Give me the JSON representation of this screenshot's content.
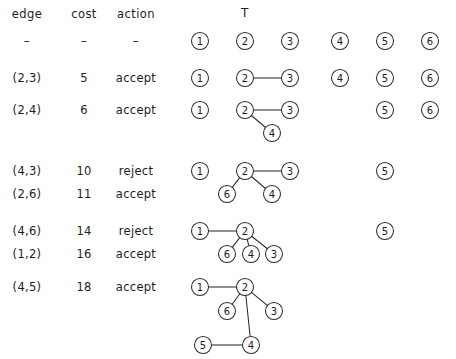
{
  "figure": {
    "title_label": "T",
    "columns": [
      {
        "key": "edge",
        "label": "edge",
        "x": 27
      },
      {
        "key": "cost",
        "label": "cost",
        "x": 84
      },
      {
        "key": "action",
        "label": "action",
        "x": 136
      }
    ],
    "header_rule": "–",
    "node_radius": 8.5,
    "node_ids": [
      "1",
      "2",
      "3",
      "4",
      "5",
      "6"
    ],
    "rows": [
      {
        "edge": "–",
        "cost": "–",
        "action": "–",
        "text_y": 41,
        "is_rule_row": true,
        "nodes": [
          {
            "id": "1",
            "x": 200,
            "y": 41
          },
          {
            "id": "2",
            "x": 245,
            "y": 41
          },
          {
            "id": "3",
            "x": 290,
            "y": 41
          },
          {
            "id": "4",
            "x": 340,
            "y": 41
          },
          {
            "id": "5",
            "x": 385,
            "y": 41
          },
          {
            "id": "6",
            "x": 430,
            "y": 41
          }
        ],
        "edges": []
      },
      {
        "edge": "(2,3)",
        "cost": "5",
        "action": "accept",
        "text_y": 78,
        "is_rule_row": false,
        "nodes": [
          {
            "id": "1",
            "x": 200,
            "y": 78
          },
          {
            "id": "2",
            "x": 245,
            "y": 78
          },
          {
            "id": "3",
            "x": 290,
            "y": 78
          },
          {
            "id": "4",
            "x": 340,
            "y": 78
          },
          {
            "id": "5",
            "x": 385,
            "y": 78
          },
          {
            "id": "6",
            "x": 430,
            "y": 78
          }
        ],
        "edges": [
          [
            "2",
            "3"
          ]
        ]
      },
      {
        "edge": "(2,4)",
        "cost": "6",
        "action": "accept",
        "text_y": 110,
        "is_rule_row": false,
        "nodes": [
          {
            "id": "1",
            "x": 200,
            "y": 110
          },
          {
            "id": "2",
            "x": 245,
            "y": 110
          },
          {
            "id": "3",
            "x": 290,
            "y": 110
          },
          {
            "id": "4",
            "x": 272,
            "y": 133
          },
          {
            "id": "5",
            "x": 385,
            "y": 110
          },
          {
            "id": "6",
            "x": 430,
            "y": 110
          }
        ],
        "edges": [
          [
            "2",
            "3"
          ],
          [
            "2",
            "4"
          ]
        ]
      },
      {
        "edge": "(4,3)",
        "cost": "10",
        "action": "reject",
        "text_y": 171,
        "is_rule_row": false,
        "nodes": [
          {
            "id": "1",
            "x": 200,
            "y": 171
          },
          {
            "id": "2",
            "x": 245,
            "y": 171
          },
          {
            "id": "3",
            "x": 290,
            "y": 171
          },
          {
            "id": "4",
            "x": 272,
            "y": 194
          },
          {
            "id": "5",
            "x": 385,
            "y": 171
          },
          {
            "id": "6",
            "x": 227,
            "y": 194
          }
        ],
        "edges": [
          [
            "2",
            "3"
          ],
          [
            "2",
            "4"
          ],
          [
            "2",
            "6"
          ]
        ]
      },
      {
        "edge": "(2,6)",
        "cost": "11",
        "action": "accept",
        "text_y": 194,
        "is_rule_row": false,
        "nodes": [],
        "edges": []
      },
      {
        "edge": "(4,6)",
        "cost": "14",
        "action": "reject",
        "text_y": 231,
        "is_rule_row": false,
        "nodes": [
          {
            "id": "1",
            "x": 200,
            "y": 231
          },
          {
            "id": "2",
            "x": 245,
            "y": 231
          },
          {
            "id": "3",
            "x": 274,
            "y": 254
          },
          {
            "id": "4",
            "x": 251,
            "y": 254
          },
          {
            "id": "5",
            "x": 385,
            "y": 231
          },
          {
            "id": "6",
            "x": 227,
            "y": 254
          }
        ],
        "edges": [
          [
            "1",
            "2"
          ],
          [
            "2",
            "3"
          ],
          [
            "2",
            "4"
          ],
          [
            "2",
            "6"
          ]
        ]
      },
      {
        "edge": "(1,2)",
        "cost": "16",
        "action": "accept",
        "text_y": 254,
        "is_rule_row": false,
        "nodes": [],
        "edges": []
      },
      {
        "edge": "(4,5)",
        "cost": "18",
        "action": "accept",
        "text_y": 287,
        "is_rule_row": false,
        "nodes": [
          {
            "id": "1",
            "x": 200,
            "y": 287
          },
          {
            "id": "2",
            "x": 245,
            "y": 287
          },
          {
            "id": "3",
            "x": 274,
            "y": 311
          },
          {
            "id": "4",
            "x": 251,
            "y": 345
          },
          {
            "id": "5",
            "x": 203,
            "y": 345
          },
          {
            "id": "6",
            "x": 227,
            "y": 311
          }
        ],
        "edges": [
          [
            "1",
            "2"
          ],
          [
            "2",
            "3"
          ],
          [
            "2",
            "6"
          ],
          [
            "2",
            "4"
          ],
          [
            "4",
            "5"
          ]
        ]
      }
    ]
  }
}
